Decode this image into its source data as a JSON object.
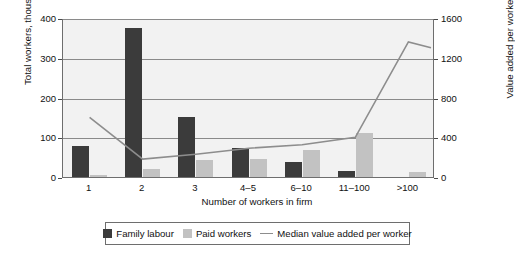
{
  "chart_data": {
    "type": "bar",
    "title": "",
    "xlabel": "Number of workers in firm",
    "ylabel": "Total workers, thousands",
    "y2label": "Value added per worker, US$",
    "categories": [
      "1",
      "2",
      "3",
      "4–5",
      "6–10",
      "11–100",
      ">100"
    ],
    "ylim": [
      0,
      400
    ],
    "yticks": [
      "0",
      "100",
      "200",
      "300",
      "400"
    ],
    "y2lim": [
      0,
      1600
    ],
    "y2ticks": [
      "0",
      "400",
      "800",
      "1200",
      "1600"
    ],
    "grid": true,
    "legend_position": "bottom",
    "series": [
      {
        "name": "Family labour",
        "type": "bar",
        "axis": "left",
        "color": "#3b3b3b",
        "values": [
          78,
          375,
          152,
          72,
          38,
          15,
          0
        ]
      },
      {
        "name": "Paid workers",
        "type": "bar",
        "axis": "left",
        "color": "#c2c2c2",
        "values": [
          5,
          20,
          42,
          45,
          67,
          110,
          12
        ]
      },
      {
        "name": "Median value added per worker",
        "type": "line",
        "axis": "right",
        "color": "#8d8d8d",
        "values": [
          620,
          200,
          250,
          310,
          345,
          420,
          1380
        ]
      }
    ],
    "line_end_value": 1320
  },
  "legend": {
    "items": [
      {
        "label": "Family labour",
        "icon": "square-swatch-dark"
      },
      {
        "label": "Paid workers",
        "icon": "square-swatch-light"
      },
      {
        "label": "Median value added per worker",
        "icon": "line-swatch"
      }
    ]
  },
  "colors": {
    "family_labour": "#3b3b3b",
    "paid_workers": "#c2c2c2",
    "median_line": "#8d8d8d",
    "plot_background": "#f2f2f2",
    "grid": "#8a8a8a",
    "frame": "#6e6e6e"
  }
}
